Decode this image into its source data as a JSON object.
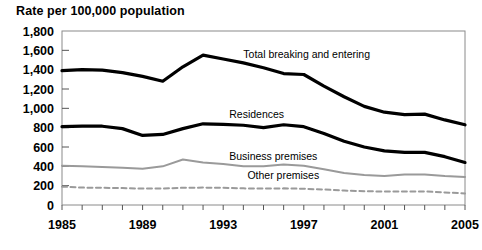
{
  "chart_data": {
    "type": "line",
    "title": "Rate per 100,000 population",
    "xlabel": "",
    "ylabel": "",
    "ylim": [
      0,
      1800
    ],
    "ytick_step": 200,
    "yticks": [
      "0",
      "200",
      "400",
      "600",
      "800",
      "1,000",
      "1,200",
      "1,400",
      "1,600",
      "1,800"
    ],
    "xlim": [
      1985,
      2005
    ],
    "x": [
      1985,
      1986,
      1987,
      1988,
      1989,
      1990,
      1991,
      1992,
      1993,
      1994,
      1995,
      1996,
      1997,
      1998,
      1999,
      2000,
      2001,
      2002,
      2003,
      2004,
      2005
    ],
    "xticks": [
      1985,
      1986,
      1987,
      1988,
      1989,
      1990,
      1991,
      1992,
      1993,
      1994,
      1995,
      1996,
      1997,
      1998,
      1999,
      2000,
      2001,
      2002,
      2003,
      2004,
      2005
    ],
    "xtick_labels": [
      "1985",
      "",
      "",
      "",
      "1989",
      "",
      "",
      "",
      "1993",
      "",
      "",
      "",
      "1997",
      "",
      "",
      "",
      "2001",
      "",
      "",
      "",
      "2005"
    ],
    "grid": false,
    "legend_position": "inline-annotations",
    "series": [
      {
        "name": "Total breaking and entering",
        "color": "#000000",
        "style": "solid",
        "width": 3.2,
        "label_x": 1994.0,
        "label_y": 1520,
        "values": [
          1390,
          1400,
          1395,
          1370,
          1330,
          1280,
          1430,
          1550,
          1510,
          1470,
          1420,
          1360,
          1350,
          1230,
          1120,
          1020,
          960,
          935,
          940,
          880,
          830
        ]
      },
      {
        "name": "Residences",
        "color": "#000000",
        "style": "solid",
        "width": 3.2,
        "label_x": 1993.3,
        "label_y": 900,
        "values": [
          810,
          815,
          815,
          790,
          720,
          730,
          790,
          840,
          835,
          825,
          800,
          830,
          810,
          740,
          660,
          600,
          560,
          545,
          545,
          500,
          440
        ]
      },
      {
        "name": "Business premises",
        "color": "#9a9a9a",
        "style": "solid",
        "width": 2.0,
        "label_x": 1993.3,
        "label_y": 470,
        "values": [
          405,
          400,
          392,
          385,
          375,
          400,
          470,
          440,
          425,
          400,
          400,
          420,
          405,
          370,
          330,
          310,
          300,
          315,
          315,
          300,
          290
        ]
      },
      {
        "name": "Other premises",
        "color": "#9a9a9a",
        "style": "dashed",
        "width": 2.0,
        "label_x": 1994.2,
        "label_y": 265,
        "values": [
          190,
          180,
          178,
          175,
          170,
          170,
          178,
          180,
          178,
          172,
          170,
          172,
          168,
          160,
          150,
          142,
          140,
          140,
          140,
          130,
          120
        ]
      }
    ]
  },
  "axes": {
    "frame_color": "#8a8a8a",
    "tick_color": "#555555",
    "plot": {
      "left": 62,
      "top": 31,
      "right": 465,
      "bottom": 205
    }
  }
}
